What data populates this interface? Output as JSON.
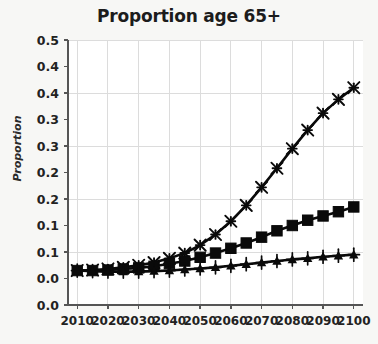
{
  "chart_data": {
    "type": "line",
    "title": "Proportion age 65+",
    "xlabel": "",
    "ylabel": "Proportion",
    "x": [
      2010,
      2015,
      2020,
      2025,
      2030,
      2035,
      2040,
      2045,
      2050,
      2055,
      2060,
      2065,
      2070,
      2075,
      2080,
      2085,
      2090,
      2095,
      2100
    ],
    "xlim": [
      2007,
      2103
    ],
    "ylim": [
      0.0,
      0.5
    ],
    "xticks": [
      2010,
      2020,
      2030,
      2040,
      2050,
      2060,
      2070,
      2080,
      2090,
      2100
    ],
    "xtick_labels": [
      "2010",
      "2020",
      "2030",
      "2040",
      "2050",
      "2060",
      "2070",
      "2080",
      "2090",
      "2100"
    ],
    "yticks": [
      0.0,
      0.05,
      0.1,
      0.15,
      0.2,
      0.25,
      0.3,
      0.35,
      0.4,
      0.45,
      0.5
    ],
    "ytick_labels": [
      "0.0",
      "0.1",
      "0.1",
      "0.2",
      "0.2",
      "0.3",
      "0.3",
      "0.4",
      "0.4",
      "0.5"
    ],
    "ytick_labels_full": [
      "0.0",
      "0.0",
      "0.1",
      "0.1",
      "0.2",
      "0.2",
      "0.3",
      "0.3",
      "0.4",
      "0.4",
      "0.5"
    ],
    "grid": true,
    "legend": "none",
    "series": [
      {
        "name": "high-growth",
        "marker": "x-star",
        "color": "#0a0a0a",
        "values": [
          0.065,
          0.066,
          0.068,
          0.071,
          0.075,
          0.08,
          0.088,
          0.098,
          0.113,
          0.133,
          0.158,
          0.188,
          0.222,
          0.258,
          0.295,
          0.33,
          0.362,
          0.388,
          0.41
        ]
      },
      {
        "name": "mid-growth",
        "marker": "square",
        "color": "#0a0a0a",
        "values": [
          0.065,
          0.065,
          0.066,
          0.068,
          0.07,
          0.073,
          0.078,
          0.083,
          0.09,
          0.098,
          0.107,
          0.117,
          0.128,
          0.14,
          0.15,
          0.16,
          0.168,
          0.176,
          0.185
        ]
      },
      {
        "name": "low-growth",
        "marker": "triangle-plus",
        "color": "#0a0a0a",
        "values": [
          0.065,
          0.064,
          0.063,
          0.063,
          0.063,
          0.064,
          0.065,
          0.067,
          0.069,
          0.071,
          0.074,
          0.077,
          0.08,
          0.083,
          0.086,
          0.088,
          0.091,
          0.093,
          0.095
        ]
      }
    ]
  },
  "colors": {
    "figure_background": "#f7f7f5",
    "plot_background": "#ffffff",
    "grid": "#dcdcdc",
    "axis": "#555555",
    "text": "#1c1c1c",
    "series": "#0a0a0a"
  }
}
